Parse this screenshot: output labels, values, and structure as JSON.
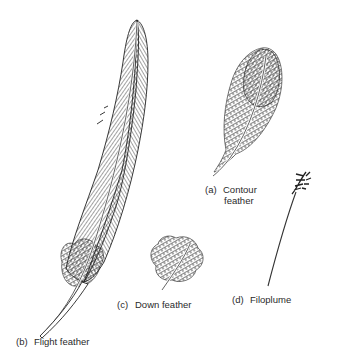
{
  "figure": {
    "feathers": [
      {
        "id": "a",
        "letter": "(a)",
        "name_line1": "Contour",
        "name_line2": "feather"
      },
      {
        "id": "b",
        "letter": "(b)",
        "name_line1": "Flight feather"
      },
      {
        "id": "c",
        "letter": "(c)",
        "name_line1": "Down feather"
      },
      {
        "id": "d",
        "letter": "(d)",
        "name_line1": "Filoplume"
      }
    ],
    "colors": {
      "ink": "#2a2a2a",
      "background": "#ffffff"
    }
  }
}
